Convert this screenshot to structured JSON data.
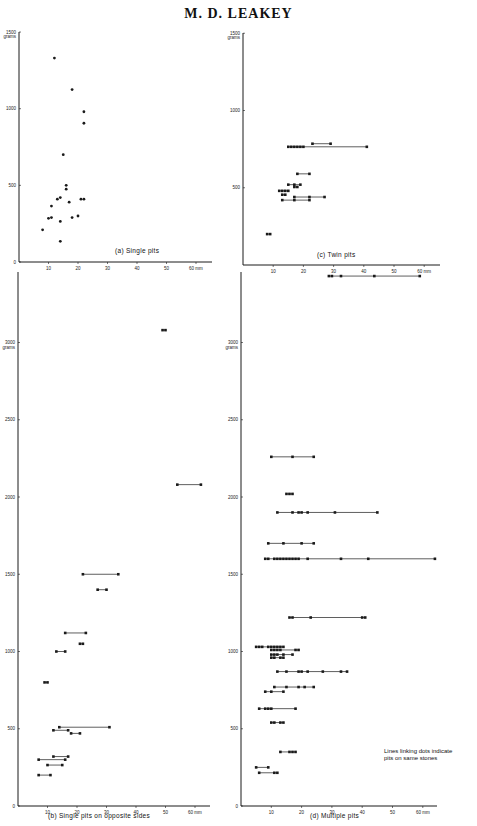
{
  "header": {
    "title": "M. D. LEAKEY"
  },
  "chart_data": [
    {
      "id": "a",
      "type": "scatter",
      "title": "(a) Single pits",
      "xlabel": "mm",
      "ylabel": "grams",
      "x_ticks": [
        "10",
        "20",
        "30",
        "40",
        "50",
        "60 mm"
      ],
      "y_ticks": [
        "0",
        "500",
        "1000",
        "1500 grams"
      ],
      "xlim": [
        0,
        65
      ],
      "ylim": [
        0,
        1500
      ],
      "grid": false,
      "points": [
        {
          "x": 12,
          "y": 1330
        },
        {
          "x": 18,
          "y": 1125
        },
        {
          "x": 22,
          "y": 980
        },
        {
          "x": 22,
          "y": 905
        },
        {
          "x": 15,
          "y": 700
        },
        {
          "x": 16,
          "y": 500
        },
        {
          "x": 16,
          "y": 475
        },
        {
          "x": 14,
          "y": 420
        },
        {
          "x": 13,
          "y": 410
        },
        {
          "x": 21,
          "y": 410
        },
        {
          "x": 22,
          "y": 410
        },
        {
          "x": 17,
          "y": 390
        },
        {
          "x": 11,
          "y": 365
        },
        {
          "x": 10,
          "y": 285
        },
        {
          "x": 11,
          "y": 290
        },
        {
          "x": 18,
          "y": 290
        },
        {
          "x": 20,
          "y": 300
        },
        {
          "x": 14,
          "y": 265
        },
        {
          "x": 8,
          "y": 210
        },
        {
          "x": 14,
          "y": 135
        }
      ]
    },
    {
      "id": "c",
      "type": "scatter",
      "title": "(c) Twin pits",
      "xlabel": "mm",
      "ylabel": "grams",
      "x_ticks": [
        "10",
        "20",
        "30",
        "40",
        "50",
        "60 mm"
      ],
      "y_ticks": [
        "500",
        "1000",
        "1500 grams"
      ],
      "xlim": [
        0,
        65
      ],
      "ylim": [
        0,
        1500
      ],
      "linked_groups": [
        [
          23,
          29
        ],
        [
          15,
          16,
          17,
          18,
          19,
          20,
          41
        ],
        [
          18,
          22
        ],
        [
          15,
          17,
          19
        ],
        [
          17,
          18
        ],
        [
          12,
          13,
          14,
          15
        ],
        [
          13,
          14
        ],
        [
          13,
          17,
          22
        ],
        [
          17,
          22,
          27
        ],
        [
          8,
          9
        ]
      ],
      "linked_group_y": [
        785,
        765,
        590,
        520,
        505,
        480,
        455,
        420,
        440,
        200
      ]
    },
    {
      "id": "b",
      "type": "scatter",
      "title": "(b) Single pits on opposite sides",
      "xlabel": "mm",
      "ylabel": "grams",
      "x_ticks": [
        "10",
        "20",
        "30",
        "40",
        "50",
        "60 mm"
      ],
      "y_ticks": [
        "0",
        "500",
        "1000",
        "1500",
        "2000",
        "2500",
        "3000 grams"
      ],
      "xlim": [
        0,
        65
      ],
      "ylim": [
        0,
        3500
      ],
      "linked_groups": [
        [
          49,
          50
        ],
        [
          54,
          62
        ],
        [
          22,
          34
        ],
        [
          27,
          30
        ],
        [
          16,
          23
        ],
        [
          21,
          22
        ],
        [
          13,
          16
        ],
        [
          9,
          10
        ],
        [
          14,
          31
        ],
        [
          12,
          17
        ],
        [
          18,
          21
        ],
        [
          12,
          17
        ],
        [
          7,
          16
        ],
        [
          10,
          15
        ],
        [
          7,
          11
        ]
      ],
      "linked_group_y": [
        3080,
        2080,
        1500,
        1400,
        1120,
        1050,
        1000,
        800,
        510,
        490,
        470,
        320,
        300,
        265,
        200
      ]
    },
    {
      "id": "d",
      "type": "scatter",
      "title": "(d) Multiple pits",
      "xlabel": "mm",
      "ylabel": "grams",
      "x_ticks": [
        "10",
        "20",
        "30",
        "40",
        "50",
        "60 mm"
      ],
      "y_ticks": [
        "0",
        "500",
        "1000",
        "1500",
        "2000",
        "2500",
        "3000 grams"
      ],
      "xlim": [
        0,
        65
      ],
      "ylim": [
        0,
        3500
      ],
      "annotation": "Lines linking dots indicate pits on same stones",
      "linked_groups": [
        [
          29,
          30,
          33,
          44,
          59
        ],
        [
          10,
          17,
          24
        ],
        [
          15,
          16,
          17
        ],
        [
          12,
          17,
          19,
          20,
          22,
          31,
          45
        ],
        [
          9,
          14,
          20,
          24
        ],
        [
          8,
          9,
          11,
          12,
          13,
          14,
          15,
          16,
          17,
          18,
          19,
          22,
          33,
          42,
          64
        ],
        [
          16,
          17,
          23,
          40,
          41
        ],
        [
          5,
          6,
          7,
          9,
          10,
          11,
          12,
          13,
          14
        ],
        [
          10,
          11,
          12,
          13,
          18,
          19
        ],
        [
          10,
          11,
          12,
          14,
          17
        ],
        [
          10,
          11,
          13,
          14
        ],
        [
          12,
          15,
          19,
          20,
          22,
          27,
          33,
          35
        ],
        [
          11,
          15,
          19,
          21,
          24
        ],
        [
          8,
          10,
          14
        ],
        [
          6,
          8,
          9,
          10,
          18
        ],
        [
          10,
          11,
          13,
          14
        ],
        [
          13,
          16,
          17,
          18
        ],
        [
          5,
          9
        ],
        [
          6,
          11,
          12
        ]
      ],
      "linked_group_y": [
        3430,
        2260,
        2020,
        1900,
        1700,
        1600,
        1220,
        1030,
        1010,
        980,
        960,
        870,
        770,
        740,
        630,
        540,
        350,
        250,
        215
      ]
    }
  ],
  "panels": {
    "a": {
      "caption": "(a)   Single pits",
      "x_unit": "60 mm",
      "y_top": "1500",
      "y_unit": "grams"
    },
    "c": {
      "caption": "(c)     Twin pits",
      "x_unit": "60 mm",
      "y_top": "1500",
      "y_unit": "grams"
    },
    "b": {
      "caption": "(b)   Single   pits  on  opposite   sides",
      "x_unit": "60 mm",
      "y_unit": "grams"
    },
    "d": {
      "caption": "(d)     Multiple    pits",
      "x_unit": "60 mm",
      "y_unit": "grams",
      "note_line1": "Lines  linking  dots indicate",
      "note_line2": "pits on same stones"
    }
  },
  "colors": {
    "ink": "#1a1a1a",
    "paper": "#ffffff"
  }
}
